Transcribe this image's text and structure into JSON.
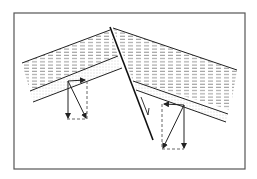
{
  "diagram": {
    "type": "geological fault cross-section with force vector diagrams",
    "colors": {
      "background": "#ffffff",
      "frame": "#555555",
      "line": "#222222",
      "hatch": "#8a8a8a",
      "dots": "#9a9a9a",
      "dashed": "#555555"
    },
    "frame": {
      "x": 14,
      "y": 13,
      "width": 231,
      "height": 156
    },
    "fault_line": {
      "x1": 110,
      "y1": 27,
      "x2": 153,
      "y2": 140
    },
    "left_block": {
      "top_edge": [
        [
          22,
          63
        ],
        [
          110,
          30
        ]
      ],
      "layer_top": [
        [
          30,
          91
        ],
        [
          118,
          56
        ]
      ],
      "layer_bottom": [
        [
          33,
          102
        ],
        [
          122,
          68
        ]
      ],
      "vector_box": {
        "x": 67,
        "y": 81,
        "width": 20,
        "height": 38
      }
    },
    "right_block": {
      "top_edge": [
        [
          113,
          28
        ],
        [
          237,
          70
        ]
      ],
      "layer_top": [
        [
          133,
          81
        ],
        [
          228,
          114
        ]
      ],
      "layer_bottom": [
        [
          136,
          90
        ],
        [
          226,
          122
        ]
      ],
      "vector_box": {
        "x": 162,
        "y": 104,
        "width": 22,
        "height": 45
      }
    },
    "slip_arrow": {
      "x1": 141,
      "y1": 97,
      "x2": 148,
      "y2": 115
    },
    "icons": [
      "arrow-down-icon",
      "arrow-diagonal-icon",
      "arrow-horizontal-icon"
    ]
  }
}
